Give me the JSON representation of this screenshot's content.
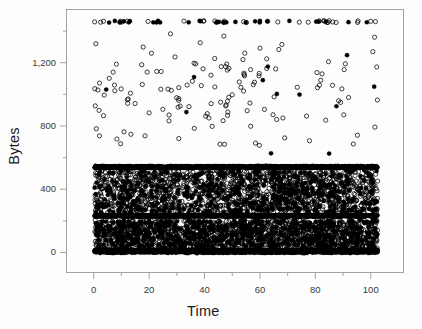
{
  "figure": {
    "name": "bytes-vs-time-scatter",
    "background": "#ffffff",
    "frame_color": "#9a9a9a",
    "marker_color": "#000000",
    "text_color": "#1a1a1a"
  },
  "chart_data": {
    "type": "scatter",
    "title": "",
    "xlabel": "Time",
    "ylabel": "Bytes",
    "xlim": [
      -10,
      112
    ],
    "ylim": [
      -130,
      1540
    ],
    "xticks": [
      0,
      20,
      40,
      60,
      80,
      100
    ],
    "xticklabels": [
      "0",
      "20",
      "40",
      "60",
      "80",
      "100"
    ],
    "yticks": [
      0,
      400,
      800,
      1200
    ],
    "yticklabels": [
      "0",
      "400",
      "800",
      "1,200"
    ],
    "minor_xticks": [
      10,
      30,
      50,
      70,
      90
    ],
    "minor_yticks": [
      200,
      600,
      1000,
      1400
    ],
    "grid": false,
    "legend": null,
    "marker": "open-circle",
    "marker_size_px": 4.2,
    "x_data_range": [
      0.3,
      102.5
    ],
    "bands": [
      {
        "name": "ceiling-row",
        "y": 1460,
        "y_jitter": 6,
        "x_count": 62,
        "kind": "row"
      },
      {
        "name": "upper-scatter",
        "y_range": [
          600,
          1400
        ],
        "x_count": 150,
        "kind": "sparse"
      },
      {
        "name": "mtu-band",
        "y": 540,
        "y_jitter": 9,
        "x_count": 1500,
        "kind": "solid"
      },
      {
        "name": "mid-scatter",
        "y_range": [
          250,
          520
        ],
        "x_count": 1900,
        "kind": "dense"
      },
      {
        "name": "ack-band",
        "y": 232,
        "y_jitter": 8,
        "x_count": 1400,
        "kind": "solid"
      },
      {
        "name": "low-scatter",
        "y_range": [
          25,
          205
        ],
        "x_count": 1900,
        "kind": "dense"
      },
      {
        "name": "zero-floor",
        "y": 8,
        "y_jitter": 14,
        "x_count": 2200,
        "kind": "solid"
      }
    ],
    "series": [
      {
        "name": "packets",
        "marker": "open-circle",
        "color": "#000000",
        "n_points_approx": 9100
      }
    ]
  }
}
